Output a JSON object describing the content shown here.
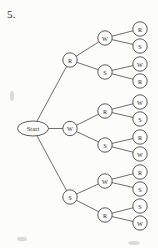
{
  "problem": {
    "number": "5."
  },
  "diagram": {
    "type": "probability-tree",
    "root": {
      "id": "start",
      "label": "Start",
      "shape": "ellipse",
      "cx": 33,
      "cy": 128.5,
      "rx": 15.5,
      "ry": 7.5
    },
    "node_radius": 7.2,
    "levels": [
      {
        "level": 1,
        "x": 70,
        "nodes": [
          {
            "id": "L1-0",
            "label": "R",
            "cy": 60
          },
          {
            "id": "L1-1",
            "label": "W",
            "cy": 128.5
          },
          {
            "id": "L1-2",
            "label": "S",
            "cy": 197
          }
        ]
      },
      {
        "level": 2,
        "x": 105,
        "nodes": [
          {
            "id": "L2-0",
            "label": "W",
            "cy": 38,
            "parent": "L1-0"
          },
          {
            "id": "L2-1",
            "label": "S",
            "cy": 72,
            "parent": "L1-0"
          },
          {
            "id": "L2-2",
            "label": "R",
            "cy": 111,
            "parent": "L1-1"
          },
          {
            "id": "L2-3",
            "label": "S",
            "cy": 145,
            "parent": "L1-1"
          },
          {
            "id": "L2-4",
            "label": "W",
            "cy": 181,
            "parent": "L1-2"
          },
          {
            "id": "L2-5",
            "label": "R",
            "cy": 215,
            "parent": "L1-2"
          }
        ]
      },
      {
        "level": 3,
        "x": 140,
        "nodes": [
          {
            "id": "L3-0",
            "label": "R",
            "cy": 29,
            "parent": "L2-0"
          },
          {
            "id": "L3-1",
            "label": "S",
            "cy": 46,
            "parent": "L2-0"
          },
          {
            "id": "L3-2",
            "label": "W",
            "cy": 64,
            "parent": "L2-1"
          },
          {
            "id": "L3-3",
            "label": "R",
            "cy": 81,
            "parent": "L2-1"
          },
          {
            "id": "L3-4",
            "label": "W",
            "cy": 102,
            "parent": "L2-2"
          },
          {
            "id": "L3-5",
            "label": "S",
            "cy": 119,
            "parent": "L2-2"
          },
          {
            "id": "L3-6",
            "label": "R",
            "cy": 137,
            "parent": "L2-3"
          },
          {
            "id": "L3-7",
            "label": "W",
            "cy": 154,
            "parent": "L2-3"
          },
          {
            "id": "L3-8",
            "label": "R",
            "cy": 172,
            "parent": "L2-4"
          },
          {
            "id": "L3-9",
            "label": "S",
            "cy": 189,
            "parent": "L2-4"
          },
          {
            "id": "L3-10",
            "label": "S",
            "cy": 206,
            "parent": "L2-5"
          },
          {
            "id": "L3-11",
            "label": "W",
            "cy": 223,
            "parent": "L2-5"
          }
        ]
      }
    ],
    "edges": [
      {
        "from": "start",
        "to": "L1-0"
      },
      {
        "from": "start",
        "to": "L1-1"
      },
      {
        "from": "start",
        "to": "L1-2"
      },
      {
        "from": "L1-0",
        "to": "L2-0"
      },
      {
        "from": "L1-0",
        "to": "L2-1"
      },
      {
        "from": "L1-1",
        "to": "L2-2"
      },
      {
        "from": "L1-1",
        "to": "L2-3"
      },
      {
        "from": "L1-2",
        "to": "L2-4"
      },
      {
        "from": "L1-2",
        "to": "L2-5"
      },
      {
        "from": "L2-0",
        "to": "L3-0"
      },
      {
        "from": "L2-0",
        "to": "L3-1"
      },
      {
        "from": "L2-1",
        "to": "L3-2"
      },
      {
        "from": "L2-1",
        "to": "L3-3"
      },
      {
        "from": "L2-2",
        "to": "L3-4"
      },
      {
        "from": "L2-2",
        "to": "L3-5"
      },
      {
        "from": "L2-3",
        "to": "L3-6"
      },
      {
        "from": "L2-3",
        "to": "L3-7"
      },
      {
        "from": "L2-4",
        "to": "L3-8"
      },
      {
        "from": "L2-4",
        "to": "L3-9"
      },
      {
        "from": "L2-5",
        "to": "L3-10"
      },
      {
        "from": "L2-5",
        "to": "L3-11"
      }
    ],
    "colors": {
      "stroke": "#3f3f3f",
      "edge": "#4a4a4a",
      "node_fill": "#fdfdfd",
      "text": "#1f1f1f",
      "background": "#fcfcfb"
    }
  }
}
